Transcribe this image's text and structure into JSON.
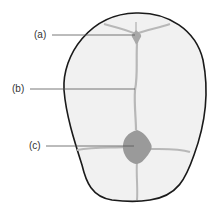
{
  "diagram": {
    "labels": [
      {
        "id": "a",
        "text": "(a)"
      },
      {
        "id": "b",
        "text": "(b)"
      },
      {
        "id": "c",
        "text": "(c)"
      }
    ]
  },
  "colors": {
    "outline": "#1a1a1a",
    "skull_fill": "#f1f1f1",
    "suture": "#b8b8b8",
    "fontanelle": "#9a9a9a",
    "leader_line": "#555555",
    "label_text": "#333333"
  }
}
